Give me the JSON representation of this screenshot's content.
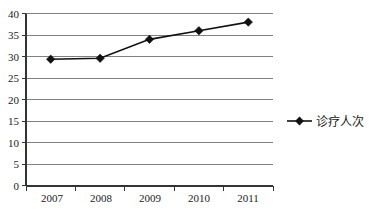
{
  "chart_data": {
    "type": "line",
    "title": "",
    "subtitle": "",
    "xlabel": "",
    "ylabel": "",
    "categories": [
      "2007",
      "2008",
      "2009",
      "2010",
      "2011"
    ],
    "series": [
      {
        "name": "诊疗人次",
        "values": [
          29.4,
          29.6,
          34.0,
          36.0,
          38.0
        ],
        "marker": "diamond",
        "color": "#111111"
      }
    ],
    "ylim": [
      0,
      40
    ],
    "ytick_labels": [
      "0",
      "5",
      "10",
      "15",
      "20",
      "25",
      "30",
      "35",
      "40"
    ],
    "ytick_values": [
      0,
      5,
      10,
      15,
      20,
      25,
      30,
      35,
      40
    ],
    "grid": true,
    "grid_color": "#808080",
    "legend_position": "right",
    "legend_entries": [
      "诊疗人次"
    ],
    "background_color": "#ffffff",
    "axis_color": "#333333"
  },
  "axes": {
    "y_tick_0": "0",
    "y_tick_1": "5",
    "y_tick_2": "10",
    "y_tick_3": "15",
    "y_tick_4": "20",
    "y_tick_5": "25",
    "y_tick_6": "30",
    "y_tick_7": "35",
    "y_tick_8": "40",
    "x_tick_0": "2007",
    "x_tick_1": "2008",
    "x_tick_2": "2009",
    "x_tick_3": "2010",
    "x_tick_4": "2011"
  },
  "legend": {
    "series_1_label": "诊疗人次"
  }
}
